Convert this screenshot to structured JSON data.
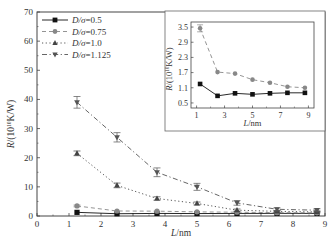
{
  "chart_data": [
    {
      "type": "line",
      "title": "",
      "xlabel": "L/nm",
      "ylabel": "R/(10^10 K/W)",
      "xlim": [
        0,
        9
      ],
      "ylim": [
        0,
        70
      ],
      "xticks": [
        0,
        1,
        2,
        3,
        4,
        5,
        6,
        7,
        8,
        9
      ],
      "yticks": [
        0,
        10,
        20,
        30,
        40,
        50,
        60,
        70
      ],
      "grid": false,
      "legend_position": "upper left",
      "x": [
        1.25,
        2.5,
        3.75,
        5.0,
        6.25,
        7.5,
        8.75
      ],
      "series": [
        {
          "name": "D/σ=0.5",
          "marker": "square",
          "line": "solid",
          "values": [
            1.25,
            0.78,
            0.88,
            0.84,
            0.88,
            0.9,
            0.9
          ],
          "errors": [
            0.2,
            0.1,
            0.1,
            0.1,
            0.1,
            0.1,
            0.1
          ]
        },
        {
          "name": "D/σ=0.75",
          "marker": "circle",
          "line": "dashed",
          "values": [
            3.45,
            1.72,
            1.66,
            1.42,
            1.3,
            1.14,
            1.1
          ],
          "errors": [
            0.3,
            0.2,
            0.2,
            0.2,
            0.2,
            0.2,
            0.2
          ]
        },
        {
          "name": "D/σ=1.0",
          "marker": "triangle-up",
          "line": "dotted",
          "values": [
            21.5,
            10.5,
            6.0,
            4.3,
            2.0,
            1.6,
            1.4
          ],
          "errors": [
            0.8,
            0.8,
            0.6,
            0.5,
            0.4,
            0.3,
            0.3
          ]
        },
        {
          "name": "D/σ=1.125",
          "marker": "triangle-down",
          "line": "dash-dot",
          "values": [
            39.0,
            27.0,
            15.0,
            10.0,
            4.5,
            2.3,
            2.0
          ],
          "errors": [
            2.0,
            1.6,
            1.5,
            1.2,
            0.8,
            0.5,
            0.5
          ]
        }
      ]
    },
    {
      "type": "line",
      "title": "inset",
      "xlabel": "L/nm",
      "ylabel": "R/(10^10 K/W)",
      "xlim": [
        0.6,
        9.4
      ],
      "ylim": [
        0.3,
        3.7
      ],
      "xticks": [
        1,
        3,
        5,
        7,
        9
      ],
      "yticks": [
        0.5,
        1.1,
        1.7,
        2.3,
        2.9,
        3.5
      ],
      "x": [
        1.25,
        2.5,
        3.75,
        5.0,
        6.25,
        7.5,
        8.75
      ],
      "series": [
        {
          "name": "D/σ=0.5",
          "marker": "square",
          "line": "solid",
          "values": [
            1.25,
            0.78,
            0.88,
            0.84,
            0.88,
            0.9,
            0.9
          ]
        },
        {
          "name": "D/σ=0.75",
          "marker": "circle",
          "line": "dashed",
          "values": [
            3.45,
            1.72,
            1.66,
            1.42,
            1.3,
            1.14,
            1.1
          ]
        }
      ]
    }
  ],
  "labels": {
    "main_xlabel_italic": "L",
    "main_xlabel_unit": "/nm",
    "ylabel_italic": "R",
    "ylabel_rest": "/(10",
    "ylabel_exp": "10",
    "ylabel_unit": "K/W)",
    "legend": [
      {
        "italic": "D/σ",
        "value": "=0.5"
      },
      {
        "italic": "D/σ",
        "value": "=0.75"
      },
      {
        "italic": "D/σ",
        "value": "=1.0"
      },
      {
        "italic": "D/σ",
        "value": "=1.125"
      }
    ]
  },
  "colors": {
    "axis": "#444444",
    "s0": "#111111",
    "s1": "#888888",
    "s2": "#444444",
    "s3": "#555555"
  }
}
